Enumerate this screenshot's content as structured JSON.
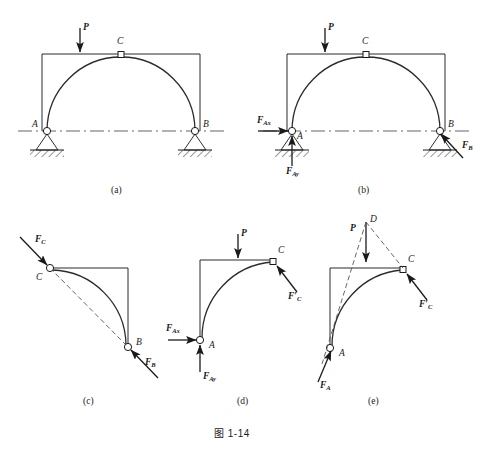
{
  "figure": {
    "caption": "图 1-14",
    "colors": {
      "ink": "#1a1a1a",
      "line": "#2b2b2b",
      "background": "#ffffff",
      "dash": "#555555"
    }
  },
  "panels": [
    {
      "tag": "(a)",
      "title": "three-hinged arch with load P",
      "points": [
        {
          "name": "A",
          "label": "A"
        },
        {
          "name": "B",
          "label": "B"
        },
        {
          "name": "C",
          "label": "C"
        }
      ],
      "forces": [
        {
          "name": "P",
          "label": "P",
          "sub": "",
          "prime": false
        }
      ]
    },
    {
      "tag": "(b)",
      "title": "free body of whole arch with support reactions",
      "points": [
        {
          "name": "A",
          "label": "A"
        },
        {
          "name": "B",
          "label": "B"
        },
        {
          "name": "C",
          "label": "C"
        }
      ],
      "forces": [
        {
          "name": "P",
          "label": "P",
          "sub": "",
          "prime": false
        },
        {
          "name": "FAx",
          "label": "F",
          "sub": "Ax",
          "prime": false
        },
        {
          "name": "FAy",
          "label": "F",
          "sub": "Ay",
          "prime": false
        },
        {
          "name": "FB",
          "label": "F",
          "sub": "B",
          "prime": false
        }
      ]
    },
    {
      "tag": "(c)",
      "title": "free body of right half CB two-force member",
      "points": [
        {
          "name": "C",
          "label": "C"
        },
        {
          "name": "B",
          "label": "B"
        }
      ],
      "forces": [
        {
          "name": "FC",
          "label": "F",
          "sub": "C",
          "prime": false
        },
        {
          "name": "FB",
          "label": "F",
          "sub": "B",
          "prime": false
        }
      ]
    },
    {
      "tag": "(d)",
      "title": "free body of left half AC with components at A",
      "points": [
        {
          "name": "A",
          "label": "A"
        },
        {
          "name": "C",
          "label": "C"
        }
      ],
      "forces": [
        {
          "name": "P",
          "label": "P",
          "sub": "",
          "prime": false
        },
        {
          "name": "FAx",
          "label": "F",
          "sub": "Ax",
          "prime": false
        },
        {
          "name": "FAy",
          "label": "F",
          "sub": "Ay",
          "prime": false
        },
        {
          "name": "FCprime",
          "label": "F",
          "sub": "C",
          "prime": true
        }
      ]
    },
    {
      "tag": "(e)",
      "title": "free body of left half AC using three-force concurrency at D",
      "points": [
        {
          "name": "A",
          "label": "A"
        },
        {
          "name": "C",
          "label": "C"
        },
        {
          "name": "D",
          "label": "D"
        }
      ],
      "forces": [
        {
          "name": "P",
          "label": "P",
          "sub": "",
          "prime": false
        },
        {
          "name": "FA",
          "label": "F",
          "sub": "A",
          "prime": false
        },
        {
          "name": "FCprime",
          "label": "F",
          "sub": "C",
          "prime": true
        }
      ]
    }
  ],
  "labels": {
    "panel_a": {
      "tag": "(a)",
      "A": "A",
      "B": "B",
      "C": "C",
      "P": "P"
    },
    "panel_b": {
      "tag": "(b)",
      "A": "A",
      "B": "B",
      "C": "C",
      "P": "P",
      "FAx_main": "F",
      "FAx_sub": "Ax",
      "FAy_main": "F",
      "FAy_sub": "Ay",
      "FB_main": "F",
      "FB_sub": "B"
    },
    "panel_c": {
      "tag": "(c)",
      "B": "B",
      "C": "C",
      "FC_main": "F",
      "FC_sub": "C",
      "FB_main": "F",
      "FB_sub": "B"
    },
    "panel_d": {
      "tag": "(d)",
      "A": "A",
      "C": "C",
      "P": "P",
      "FAx_main": "F",
      "FAx_sub": "Ax",
      "FAy_main": "F",
      "FAy_sub": "Ay",
      "FCp_main": "F",
      "FCp_prime": "′",
      "FCp_sub": "C"
    },
    "panel_e": {
      "tag": "(e)",
      "A": "A",
      "C": "C",
      "D": "D",
      "P": "P",
      "FA_main": "F",
      "FA_sub": "A",
      "FCp_main": "F",
      "FCp_prime": "′",
      "FCp_sub": "C"
    }
  }
}
